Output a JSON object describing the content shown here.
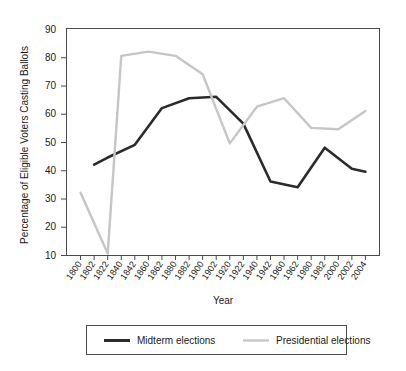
{
  "chart_data": {
    "type": "line",
    "title": "",
    "xlabel": "Year",
    "ylabel": "Percentage of Eligible Voters Casting Ballots",
    "ylim": [
      10,
      90
    ],
    "yticks": [
      10,
      20,
      30,
      40,
      50,
      60,
      70,
      80,
      90
    ],
    "grid": false,
    "legend_position": "bottom",
    "categories": [
      "1800",
      "1802",
      "1822",
      "1840",
      "1842",
      "1860",
      "1862",
      "1880",
      "1882",
      "1900",
      "1902",
      "1920",
      "1922",
      "1940",
      "1942",
      "1960",
      "1962",
      "1980",
      "1982",
      "2000",
      "2002",
      "2004"
    ],
    "series": [
      {
        "name": "Midterm elections",
        "color": "#2b2b2b",
        "points": [
          {
            "x": "1802",
            "y": 42
          },
          {
            "x": "1822",
            "y": 44.5
          },
          {
            "x": "1842",
            "y": 49
          },
          {
            "x": "1862",
            "y": 62
          },
          {
            "x": "1882",
            "y": 65.5
          },
          {
            "x": "1902",
            "y": 66
          },
          {
            "x": "1922",
            "y": 56.5
          },
          {
            "x": "1942",
            "y": 36
          },
          {
            "x": "1962",
            "y": 34
          },
          {
            "x": "1982",
            "y": 48
          },
          {
            "x": "2002",
            "y": 40.5
          },
          {
            "x": "2004",
            "y": 39.5
          }
        ]
      },
      {
        "name": "Presidential elections",
        "color": "#c6c6c6",
        "points": [
          {
            "x": "1800",
            "y": 32
          },
          {
            "x": "1822",
            "y": 10.5
          },
          {
            "x": "1840",
            "y": 80.5
          },
          {
            "x": "1860",
            "y": 82
          },
          {
            "x": "1880",
            "y": 80.5
          },
          {
            "x": "1900",
            "y": 74
          },
          {
            "x": "1920",
            "y": 49.5
          },
          {
            "x": "1940",
            "y": 62.5
          },
          {
            "x": "1960",
            "y": 65.5
          },
          {
            "x": "1980",
            "y": 55
          },
          {
            "x": "2000",
            "y": 54.5
          },
          {
            "x": "2004",
            "y": 61
          }
        ]
      }
    ]
  },
  "legend": {
    "items": [
      {
        "label": "Midterm elections",
        "color": "#2b2b2b"
      },
      {
        "label": "Presidential elections",
        "color": "#c6c6c6"
      }
    ]
  }
}
